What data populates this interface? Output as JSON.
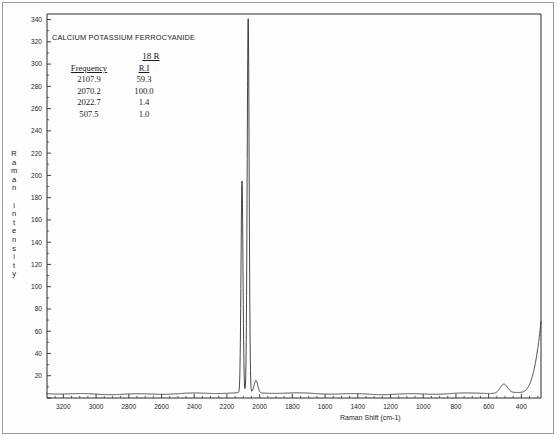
{
  "annotation": {
    "sample_title": "CALCIUM POTASSIUM FERROCYANIDE",
    "run_id": "18 R",
    "columns": {
      "frequency": "Frequency",
      "ri": "R.I"
    },
    "rows": [
      {
        "frequency": "2107.9",
        "ri": "59.3"
      },
      {
        "frequency": "2070.2",
        "ri": "100.0"
      },
      {
        "frequency": "2022.7",
        "ri": "1.4"
      },
      {
        "frequency": "507.5",
        "ri": "1.0"
      }
    ]
  },
  "axes": {
    "y_title_text": "R\na\nm\na\nn\n\ni\nn\nt\ne\nn\ns\ni\nt\ny",
    "x_title": "Raman Shift (cm-1)"
  },
  "chart_data": {
    "type": "line",
    "title": "CALCIUM POTASSIUM FERROCYANIDE",
    "xlabel": "Raman Shift (cm-1)",
    "ylabel": "Raman intensity",
    "xlim": [
      3300,
      280
    ],
    "ylim": [
      0,
      345
    ],
    "x_reversed": true,
    "grid": false,
    "legend": null,
    "xticks": [
      3200,
      3000,
      2800,
      2600,
      2400,
      2200,
      2000,
      1800,
      1600,
      1400,
      1200,
      1000,
      800,
      600,
      400
    ],
    "yticks": [
      0,
      20,
      40,
      60,
      80,
      100,
      120,
      140,
      160,
      180,
      200,
      220,
      240,
      260,
      280,
      300,
      320,
      340
    ],
    "baseline": 4,
    "peaks": [
      {
        "frequency": 2107.9,
        "relative_intensity": 59.3,
        "height": 190,
        "width": 7
      },
      {
        "frequency": 2070.2,
        "relative_intensity": 100.0,
        "height": 336,
        "width": 7
      },
      {
        "frequency": 2022.7,
        "relative_intensity": 1.4,
        "height": 11,
        "width": 13
      },
      {
        "frequency": 507.5,
        "relative_intensity": 1.0,
        "height": 8,
        "width": 26
      }
    ],
    "rayleigh_rise": {
      "start_x": 420,
      "end_x": 300,
      "end_height": 40
    }
  }
}
